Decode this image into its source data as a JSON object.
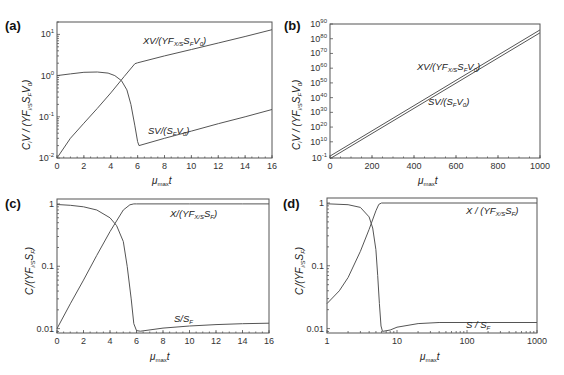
{
  "figure": {
    "panels": [
      {
        "id": "a",
        "label": "(a)"
      },
      {
        "id": "b",
        "label": "(b)"
      },
      {
        "id": "c",
        "label": "(c)"
      },
      {
        "id": "d",
        "label": "(d)"
      }
    ]
  },
  "chart_data": [
    {
      "panel": "(a)",
      "type": "line",
      "xlabel": "μmax t",
      "ylabel": "Ci V / (YF i/S SF V0)",
      "xscale": "linear",
      "yscale": "log",
      "xlim": [
        0,
        16
      ],
      "ylim": [
        0.01,
        20
      ],
      "xticks": [
        0,
        2,
        4,
        6,
        8,
        10,
        12,
        14,
        16
      ],
      "yticks": [
        0.01,
        0.1,
        1,
        10
      ],
      "ytick_labels": [
        "10-2",
        "10-1",
        "100",
        "101"
      ],
      "grid": false,
      "series": [
        {
          "name": "XV/(YF X/S SF V0)",
          "x": [
            0,
            1,
            2,
            3,
            4,
            5,
            5.8,
            6,
            8,
            10,
            12,
            14,
            16
          ],
          "y": [
            0.01,
            0.03,
            0.07,
            0.16,
            0.38,
            0.95,
            1.95,
            2.05,
            3.0,
            4.3,
            6.2,
            8.9,
            13.0
          ]
        },
        {
          "name": "SV/(SF V0)",
          "x": [
            0,
            1,
            2,
            3,
            3.8,
            4.3,
            4.8,
            5.2,
            5.5,
            5.8,
            6.0,
            6.1,
            8,
            10,
            12,
            14,
            16
          ],
          "y": [
            1.0,
            1.1,
            1.2,
            1.22,
            1.15,
            1.0,
            0.75,
            0.45,
            0.2,
            0.06,
            0.025,
            0.02,
            0.03,
            0.045,
            0.068,
            0.1,
            0.15
          ]
        }
      ]
    },
    {
      "panel": "(b)",
      "type": "line",
      "xlabel": "μmax t",
      "ylabel": "Ci V / (YF i/S SF V0)",
      "xscale": "linear",
      "yscale": "log",
      "xlim": [
        0,
        1000
      ],
      "ylim_exponent": [
        -1,
        90
      ],
      "xticks": [
        0,
        200,
        400,
        600,
        800,
        1000
      ],
      "ytick_exponents": [
        -1,
        10,
        20,
        30,
        40,
        50,
        60,
        70,
        80,
        90
      ],
      "ytick_labels": [
        "10-1",
        "1010",
        "1020",
        "1030",
        "1040",
        "1050",
        "1060",
        "1070",
        "1080",
        "1090"
      ],
      "grid": false,
      "series": [
        {
          "name": "XV/(YF X/S SF V0)",
          "x": [
            0,
            1000
          ],
          "log10_y": [
            0.3,
            86
          ]
        },
        {
          "name": "SV/(SF V0)",
          "x": [
            0,
            1000
          ],
          "log10_y": [
            -1.5,
            84
          ]
        }
      ]
    },
    {
      "panel": "(c)",
      "type": "line",
      "xlabel": "μmax t",
      "ylabel": "Ci / (YF i/S SF)",
      "xscale": "linear",
      "yscale": "log",
      "xlim": [
        0,
        16
      ],
      "ylim": [
        0.0085,
        1.2
      ],
      "xticks": [
        0,
        2,
        4,
        6,
        8,
        10,
        12,
        14,
        16
      ],
      "yticks": [
        0.01,
        0.1,
        1
      ],
      "ytick_labels": [
        "0.01",
        "0.1",
        "1"
      ],
      "grid": false,
      "series": [
        {
          "name": "X/(YF X/S SF)",
          "x": [
            0,
            1,
            2,
            3,
            4,
            5,
            5.5,
            5.8,
            6,
            8,
            10,
            12,
            14,
            16
          ],
          "y": [
            0.01,
            0.025,
            0.06,
            0.15,
            0.36,
            0.8,
            0.97,
            1.0,
            1.0,
            1.0,
            1.0,
            1.0,
            1.0,
            1.0
          ]
        },
        {
          "name": "S/SF",
          "x": [
            0,
            1,
            2,
            3,
            4,
            4.5,
            5,
            5.3,
            5.6,
            5.8,
            6.0,
            6.3,
            8,
            10,
            12,
            14,
            16
          ],
          "y": [
            0.98,
            0.95,
            0.9,
            0.8,
            0.6,
            0.45,
            0.25,
            0.1,
            0.03,
            0.012,
            0.0093,
            0.0091,
            0.0102,
            0.011,
            0.0116,
            0.012,
            0.0122
          ]
        }
      ]
    },
    {
      "panel": "(d)",
      "type": "line",
      "xlabel": "μmax t",
      "ylabel": "Ci / (YF i/S SF)",
      "xscale": "log",
      "yscale": "log",
      "xlim": [
        1,
        1000
      ],
      "ylim": [
        0.0085,
        1.2
      ],
      "xticks": [
        1,
        10,
        100,
        1000
      ],
      "yticks": [
        0.01,
        0.1,
        1
      ],
      "ytick_labels": [
        "0.01",
        "0.1",
        "1"
      ],
      "grid": false,
      "series": [
        {
          "name": "X / (YF X/S SF)",
          "x": [
            1,
            1.5,
            2,
            3,
            4,
            5,
            5.5,
            6,
            10,
            100,
            1000
          ],
          "y": [
            0.025,
            0.04,
            0.065,
            0.17,
            0.38,
            0.75,
            0.95,
            1.0,
            1.0,
            1.0,
            1.0
          ]
        },
        {
          "name": "S / SF",
          "x": [
            1,
            2,
            3,
            4,
            4.5,
            5,
            5.3,
            5.6,
            5.9,
            6.2,
            8,
            10,
            20,
            40,
            100,
            1000
          ],
          "y": [
            0.97,
            0.94,
            0.85,
            0.6,
            0.4,
            0.18,
            0.07,
            0.025,
            0.011,
            0.009,
            0.0095,
            0.0105,
            0.012,
            0.0125,
            0.0125,
            0.0125
          ]
        }
      ]
    }
  ],
  "labels": {
    "a": {
      "panel": "(a)",
      "xv": "XV/(YF",
      "xv_sub": "X/S",
      "xv_rest": "S",
      "xv_sub2": "F",
      "xv_tail": "V",
      "xv_sub3": "0",
      "xv_close": ")",
      "sv": "SV/(S",
      "sv_sub": "F",
      "sv_mid": "V",
      "sv_sub2": "0",
      "sv_close": ")",
      "xtitle": "μ",
      "xtitle_sub": "max",
      "xtitle_t": "t",
      "ytitle": "C",
      "ytitle_sub": "i",
      "ytitle_mid": "V / (YF",
      "ytitle_sub2": "i/S",
      "ytitle_mid2": "S",
      "ytitle_sub3": "F",
      "ytitle_mid3": "V",
      "ytitle_sub4": "0",
      "ytitle_close": ")"
    },
    "b": {
      "panel": "(b)",
      "xv": "XV/(YF",
      "xv_sub": "X/S",
      "xv_rest": "S",
      "xv_sub2": "F",
      "xv_tail": "V",
      "xv_sub3": "0",
      "xv_close": ")",
      "sv": "SV/(S",
      "sv_sub": "F",
      "sv_mid": "V",
      "sv_sub2": "0",
      "sv_close": ")",
      "xtitle": "μ",
      "xtitle_sub": "max",
      "xtitle_t": "t",
      "ytitle": "C",
      "ytitle_sub": "i",
      "ytitle_mid": "V / (YF",
      "ytitle_sub2": "i/S",
      "ytitle_mid2": "S",
      "ytitle_sub3": "F",
      "ytitle_mid3": "V",
      "ytitle_sub4": "0",
      "ytitle_close": ")"
    },
    "c": {
      "panel": "(c)",
      "x": "X/(YF",
      "x_sub": "X/S",
      "x_rest": "S",
      "x_sub2": "F",
      "x_close": ")",
      "s": "S/S",
      "s_sub": "F",
      "xtitle": "μ",
      "xtitle_sub": "max",
      "xtitle_t": "t",
      "ytitle": "C",
      "ytitle_sub": "i",
      "ytitle_mid": "/(YF",
      "ytitle_sub2": "i/S",
      "ytitle_mid2": "S",
      "ytitle_sub3": "F",
      "ytitle_close": ")"
    },
    "d": {
      "panel": "(d)",
      "x": "X / (YF",
      "x_sub": "X/S",
      "x_rest": "S",
      "x_sub2": "F",
      "x_close": ")",
      "s": "S / S",
      "s_sub": "F",
      "xtitle": "μ",
      "xtitle_sub": "max",
      "xtitle_t": "t",
      "ytitle": "C",
      "ytitle_sub": "i",
      "ytitle_mid": "/(YF",
      "ytitle_sub2": "i/S",
      "ytitle_mid2": "S",
      "ytitle_sub3": "F",
      "ytitle_close": ")"
    }
  },
  "layout": {
    "a": {
      "left": 57,
      "right": 272,
      "top": 22,
      "bottom": 158
    },
    "b": {
      "left": 330,
      "right": 540,
      "top": 24,
      "bottom": 158
    },
    "c": {
      "left": 57,
      "right": 269,
      "top": 199,
      "bottom": 333
    },
    "d": {
      "left": 327,
      "right": 537,
      "top": 198,
      "bottom": 333
    }
  },
  "colors": {
    "line": "#555555",
    "text": "#222222",
    "background": "#ffffff"
  }
}
